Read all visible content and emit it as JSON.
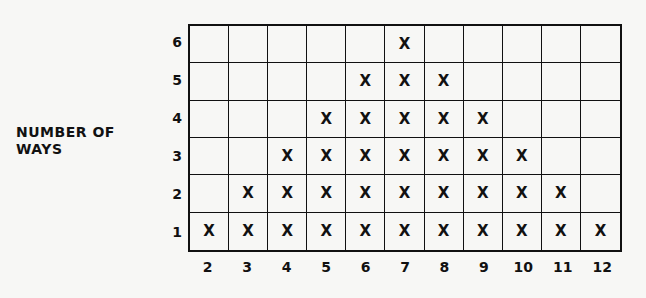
{
  "chart_data": {
    "type": "table",
    "title": "",
    "xlabel": "",
    "ylabel": "NUMBER OF WAYS",
    "ylabel_lines": [
      "NUMBER OF",
      "WAYS"
    ],
    "categories": [
      "2",
      "3",
      "4",
      "5",
      "6",
      "7",
      "8",
      "9",
      "10",
      "11",
      "12"
    ],
    "y_ticks": [
      "6",
      "5",
      "4",
      "3",
      "2",
      "1"
    ],
    "values": [
      1,
      2,
      3,
      4,
      5,
      6,
      5,
      4,
      3,
      2,
      1
    ],
    "marker": "X",
    "ylim": [
      0,
      6
    ],
    "grid": true
  }
}
